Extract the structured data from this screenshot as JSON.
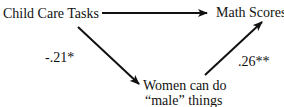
{
  "diagram": {
    "type": "mediation-path-diagram",
    "nodes": [
      {
        "id": "predictor",
        "label": "Child Care Tasks"
      },
      {
        "id": "outcome",
        "label": "Math Scores"
      },
      {
        "id": "mediator",
        "label_line1": "Women can do",
        "label_line2": "“male” things"
      }
    ],
    "edges": [
      {
        "from": "predictor",
        "to": "outcome",
        "coefficient": ".xx"
      },
      {
        "from": "predictor",
        "to": "mediator",
        "coefficient": "-.21*"
      },
      {
        "from": "mediator",
        "to": "outcome",
        "coefficient": ".26**"
      }
    ],
    "colors": {
      "ink": "#111111",
      "background": "#ffffff"
    }
  }
}
